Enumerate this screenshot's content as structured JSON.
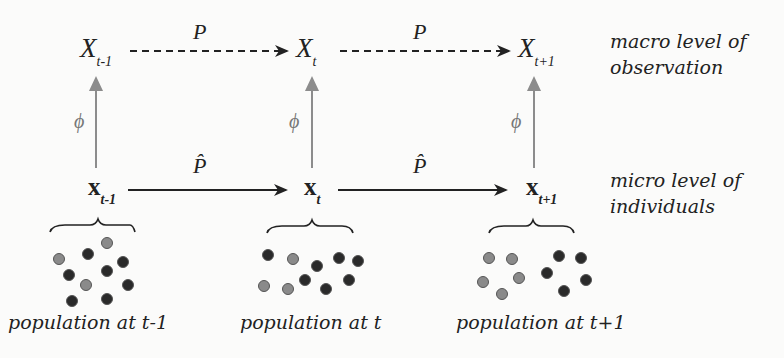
{
  "macro": {
    "nodes": [
      {
        "base": "X",
        "sub": "t-1"
      },
      {
        "base": "X",
        "sub": "t"
      },
      {
        "base": "X",
        "sub": "t+1"
      }
    ],
    "transition_label": "P",
    "label_line1": "macro level of",
    "label_line2": "observation"
  },
  "micro": {
    "nodes": [
      {
        "base": "x",
        "sub": "t-1"
      },
      {
        "base": "x",
        "sub": "t"
      },
      {
        "base": "x",
        "sub": "t+1"
      }
    ],
    "transition_label": "P̂",
    "label_line1": "micro level of",
    "label_line2": "individuals"
  },
  "mapping_label": "ϕ",
  "populations": [
    {
      "label": "population at t-1"
    },
    {
      "label": "population at t"
    },
    {
      "label": "population at t+1"
    }
  ],
  "colors": {
    "dark_dot": "#2a2a2a",
    "light_dot": "#8a8a8a",
    "mapping_arrow": "#8c8c8c",
    "transition_arrow": "#222222"
  }
}
